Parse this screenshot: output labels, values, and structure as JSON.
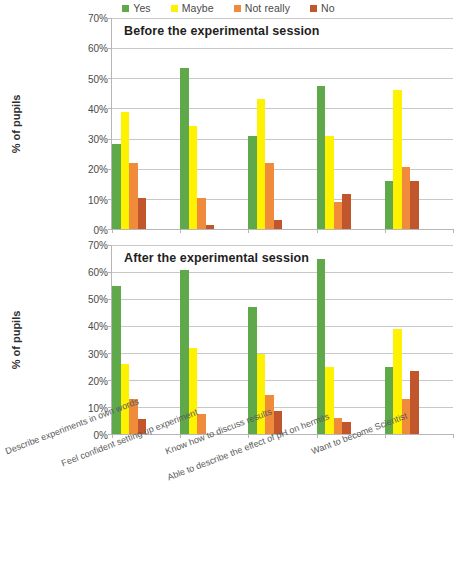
{
  "legend": {
    "items": [
      {
        "label": "Yes",
        "color": "#5FA94B"
      },
      {
        "label": "Maybe",
        "color": "#FFF200"
      },
      {
        "label": "Not really",
        "color": "#F08B3C"
      },
      {
        "label": "No",
        "color": "#C1562C"
      }
    ]
  },
  "yaxis": {
    "label": "% of pupils",
    "ticks": [
      "70%",
      "60%",
      "50%",
      "40%",
      "30%",
      "20%",
      "10%",
      "0%"
    ]
  },
  "categories": [
    "Describe experiments in own words",
    "Feel confident setting up experiment",
    "Know how to discuss results",
    "Able to describe the effect of pH on hermits",
    "Want to become Scientist"
  ],
  "chart_data": [
    {
      "type": "bar",
      "title": "Before the experimental session",
      "xlabel": "",
      "ylabel": "% of pupils",
      "ylim": [
        0,
        70
      ],
      "ytick_step": 10,
      "grid": true,
      "legend_position": "top",
      "categories": [
        "Describe experiments in own words",
        "Feel confident setting up experiment",
        "Know how to discuss results",
        "Able to describe the effect of pH on hermits",
        "Want to become Scientist"
      ],
      "series": [
        {
          "name": "Yes",
          "color": "#5FA94B",
          "values": [
            28.2,
            53.4,
            31.0,
            47.5,
            16.0
          ]
        },
        {
          "name": "Maybe",
          "color": "#FFF200",
          "values": [
            38.8,
            34.2,
            43.2,
            31.0,
            46.2
          ]
        },
        {
          "name": "Not really",
          "color": "#F08B3C",
          "values": [
            22.0,
            10.4,
            22.0,
            8.8,
            20.5
          ]
        },
        {
          "name": "No",
          "color": "#C1562C",
          "values": [
            10.4,
            1.2,
            3.0,
            11.7,
            16.0
          ]
        }
      ]
    },
    {
      "type": "bar",
      "title": "After the experimental session",
      "xlabel": "",
      "ylabel": "% of pupils",
      "ylim": [
        0,
        70
      ],
      "ytick_step": 10,
      "grid": true,
      "legend_position": "top",
      "categories": [
        "Describe experiments in own words",
        "Feel confident setting up experiment",
        "Know how to discuss results",
        "Able to describe the effect of pH on hermits",
        "Want to become Scientist"
      ],
      "series": [
        {
          "name": "Yes",
          "color": "#5FA94B",
          "values": [
            54.9,
            60.8,
            47.0,
            65.0,
            24.8
          ]
        },
        {
          "name": "Maybe",
          "color": "#FFF200",
          "values": [
            26.1,
            31.7,
            29.7,
            24.8,
            39.0
          ]
        },
        {
          "name": "Not really",
          "color": "#F08B3C",
          "values": [
            12.8,
            7.3,
            14.6,
            5.9,
            12.9
          ]
        },
        {
          "name": "No",
          "color": "#C1562C",
          "values": [
            5.7,
            0.0,
            8.7,
            4.4,
            23.3
          ]
        }
      ]
    }
  ]
}
